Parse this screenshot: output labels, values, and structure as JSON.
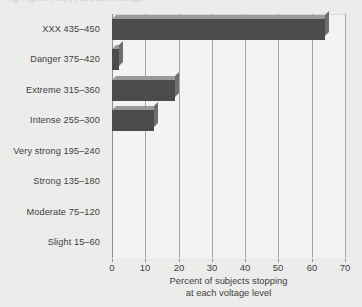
{
  "top_fragment": "ing Figure (copy) at each voltage",
  "chart_data": {
    "type": "bar",
    "orientation": "horizontal",
    "title": "",
    "subtitle": "",
    "xlabel_line1": "Percent of subjects stopping",
    "xlabel_line2": "at each voltage level",
    "ylabel": "",
    "categories": [
      "XXX 435–450",
      "Danger 375–420",
      "Extreme 315–360",
      "Intense 255–300",
      "Very strong 195–240",
      "Strong 135–180",
      "Moderate 75–120",
      "Slight 15–60"
    ],
    "values": [
      64,
      2,
      19,
      12.5,
      0,
      0,
      0,
      0
    ],
    "xlim": [
      0,
      70
    ],
    "xticks": [
      0,
      10,
      20,
      30,
      40,
      50,
      60,
      70
    ],
    "xtick_labels": [
      "0",
      "10",
      "20",
      "30",
      "40",
      "50",
      "60",
      "70"
    ],
    "grid": "vertical",
    "legend": "none",
    "bar_color": "#4b4b4b",
    "bar_top_color": "#9a9a9a",
    "bar_side_color": "#6e6e6e",
    "plot_background": "#f3f3f2",
    "page_background": "#ececeb",
    "gridline_color": "#a6a6a6",
    "axis_color": "#8e8e8e",
    "text_color": "#3f3f3f"
  }
}
